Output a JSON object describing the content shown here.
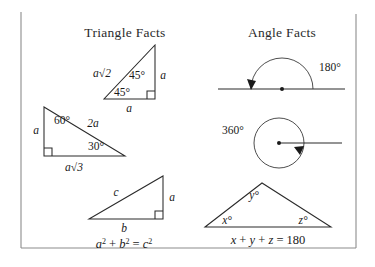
{
  "panel": {
    "background_color": "#ffffff",
    "border_color": "#8c8c8c",
    "ink_color": "#1a1a1a"
  },
  "left_panel": {
    "title": "Triangle Facts",
    "triangle_45_45_90": {
      "name": "45-45-90 right triangle",
      "hypotenuse_label": "a√2",
      "angle_top_label": "45°",
      "angle_left_label": "45°",
      "vertical_leg_label": "a",
      "horizontal_leg_label": "a",
      "right_angle_marker": true
    },
    "triangle_30_60_90": {
      "name": "30-60-90 right triangle",
      "hypotenuse_label": "2a",
      "angle_top_label": "60°",
      "angle_right_label": "30°",
      "vertical_leg_label": "a",
      "horizontal_leg_label": "a√3",
      "right_angle_marker": true
    },
    "triangle_pythagorean": {
      "name": "generic right triangle",
      "hypotenuse_label": "c",
      "vertical_leg_label": "a",
      "horizontal_leg_label": "b",
      "right_angle_marker": true,
      "equation": {
        "a": "a",
        "a_exp": "2",
        "plus": " + ",
        "b": "b",
        "b_exp": "2",
        "equals": " = ",
        "c": "c",
        "c_exp": "2",
        "full": "a² + b² = c²"
      }
    }
  },
  "right_panel": {
    "title": "Angle Facts",
    "straight_angle": {
      "name": "straight angle on a line",
      "label": "180°",
      "arc_direction": "counterclockwise",
      "has_vertex_dot": true,
      "has_arrowhead": true
    },
    "full_angle": {
      "name": "full turn around a point",
      "label": "360°",
      "arc_direction": "clockwise",
      "has_center_dot": true,
      "has_ray": true,
      "has_arrowhead": true
    },
    "triangle_angle_sum": {
      "name": "triangle interior angle sum",
      "angle_left_label": "x°",
      "angle_top_label": "y°",
      "angle_right_label": "z°",
      "equation": {
        "x": "x",
        "plus1": " + ",
        "y": "y",
        "plus2": " + ",
        "z": "z",
        "equals": " = ",
        "sum": "180",
        "full": "x + y + z = 180"
      }
    }
  }
}
